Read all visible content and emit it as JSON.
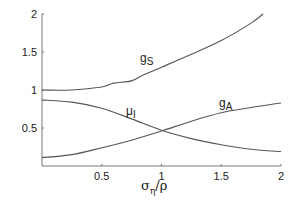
{
  "chart_data": {
    "type": "line",
    "title": "",
    "xlabel": "σ_η/ρ",
    "xlabel_parts": {
      "main": "σ",
      "sub": "η",
      "rest": "/ρ"
    },
    "ylabel": "",
    "xlim": [
      0,
      2
    ],
    "ylim": [
      0,
      2
    ],
    "grid": false,
    "legend": "inline curve labels",
    "x_ticks": [
      {
        "value": 0.5,
        "label": "0.5"
      },
      {
        "value": 1,
        "label": "1"
      },
      {
        "value": 1.5,
        "label": "1.5"
      },
      {
        "value": 2,
        "label": "2"
      }
    ],
    "y_ticks": [
      {
        "value": 0.5,
        "label": "0.5"
      },
      {
        "value": 1,
        "label": "1"
      },
      {
        "value": 1.5,
        "label": "1.5"
      },
      {
        "value": 2,
        "label": "2"
      }
    ],
    "x": [
      0,
      0.25,
      0.5,
      0.75,
      1.0,
      1.25,
      1.5,
      1.75,
      1.85,
      2.0
    ],
    "series": [
      {
        "name": "g_S",
        "label_main": "g",
        "label_sub": "S",
        "x": [
          0,
          0.25,
          0.5,
          0.6,
          0.75,
          0.85,
          1.0,
          1.25,
          1.5,
          1.75,
          1.85
        ],
        "values": [
          1.0,
          1.0,
          1.04,
          1.09,
          1.12,
          1.2,
          1.3,
          1.47,
          1.65,
          1.88,
          2.0
        ]
      },
      {
        "name": "μ_I",
        "label_main": "μ",
        "label_sub": "I",
        "x": [
          0,
          0.25,
          0.5,
          0.75,
          1.0,
          1.25,
          1.5,
          1.75,
          2.0
        ],
        "values": [
          0.87,
          0.84,
          0.76,
          0.62,
          0.47,
          0.36,
          0.28,
          0.22,
          0.19
        ]
      },
      {
        "name": "g_A",
        "label_main": "g",
        "label_sub": "A",
        "x": [
          0,
          0.25,
          0.5,
          0.75,
          1.0,
          1.25,
          1.5,
          1.75,
          2.0
        ],
        "values": [
          0.11,
          0.15,
          0.24,
          0.34,
          0.46,
          0.59,
          0.7,
          0.77,
          0.83
        ]
      }
    ]
  }
}
